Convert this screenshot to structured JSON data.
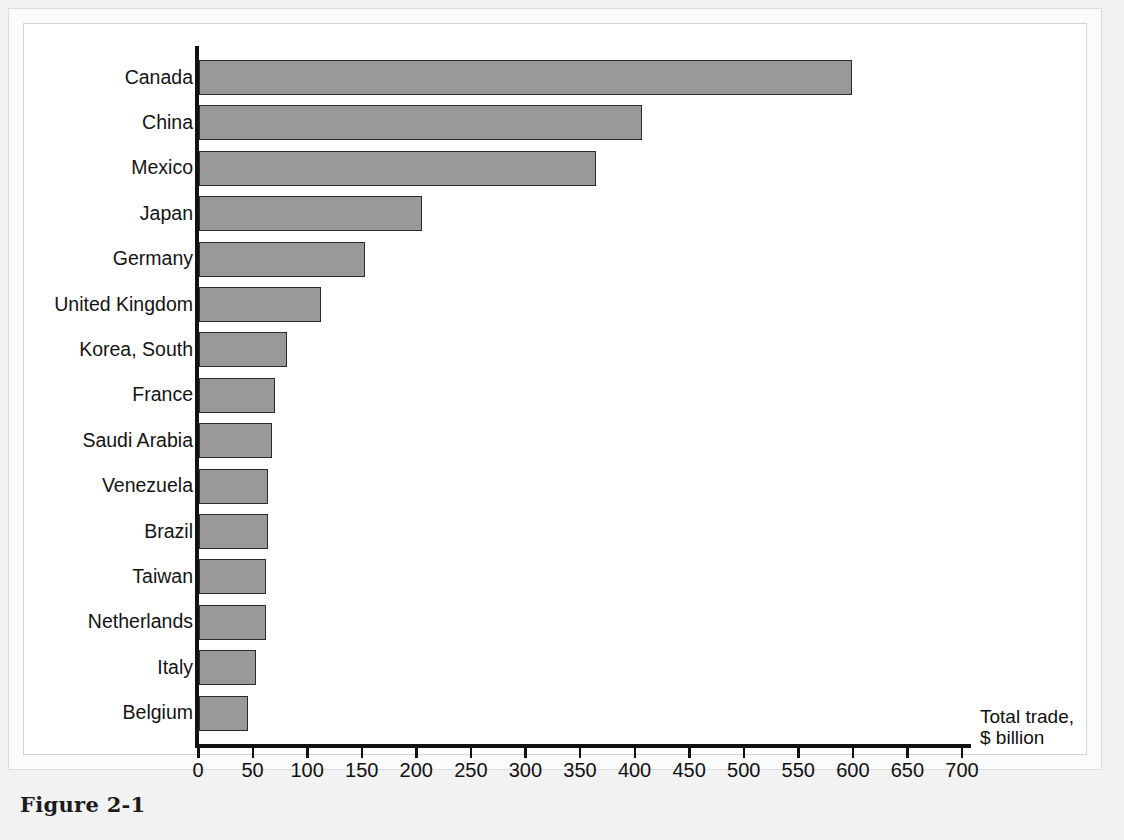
{
  "figure": {
    "caption": "Figure 2-1"
  },
  "chart_data": {
    "type": "bar",
    "orientation": "horizontal",
    "title": "",
    "subtitle": "",
    "xlabel": "Total trade, $ billion",
    "xlabel_line1": "Total trade,",
    "xlabel_line2": "$ billion",
    "ylabel": "",
    "categories": [
      "Canada",
      "China",
      "Mexico",
      "Japan",
      "Germany",
      "United Kingdom",
      "Korea, South",
      "France",
      "Saudi Arabia",
      "Venezuela",
      "Brazil",
      "Taiwan",
      "Netherlands",
      "Italy",
      "Belgium"
    ],
    "values": [
      598,
      406,
      364,
      204,
      152,
      112,
      81,
      70,
      67,
      63,
      63,
      61,
      61,
      52,
      45
    ],
    "xlim": [
      0,
      700
    ],
    "xticks": [
      0,
      50,
      100,
      150,
      200,
      250,
      300,
      350,
      400,
      450,
      500,
      550,
      600,
      650,
      700
    ],
    "xtick_labels": [
      "0",
      "50",
      "100",
      "150",
      "200",
      "250",
      "300",
      "350",
      "400",
      "450",
      "500",
      "550",
      "600",
      "650",
      "700"
    ],
    "grid": false,
    "legend": null,
    "bar_color": "#999999",
    "bar_edge_color": "#2b2b2b",
    "axis_color": "#121212",
    "background_color": "#ffffff"
  }
}
